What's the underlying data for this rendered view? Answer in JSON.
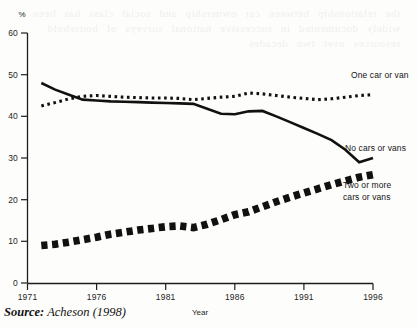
{
  "figure": {
    "y_axis_unit_label": "%",
    "x_axis_title": "Year",
    "source_prefix": "Source:",
    "source_text": "Acheson (1998)"
  },
  "chart_data": {
    "type": "line",
    "title": "",
    "subtitle": "",
    "xlabel": "Year",
    "ylabel": "%",
    "xlim": [
      1971,
      1996
    ],
    "ylim": [
      0,
      60
    ],
    "grid": false,
    "legend_position": "inline-right-of-series",
    "x_ticks": [
      "1971",
      "1976",
      "1981",
      "1986",
      "1991",
      "1996"
    ],
    "y_ticks": [
      "0",
      "10",
      "20",
      "30",
      "40",
      "50",
      "60"
    ],
    "x": [
      1972,
      1973,
      1974,
      1975,
      1976,
      1977,
      1978,
      1979,
      1980,
      1981,
      1982,
      1983,
      1984,
      1985,
      1986,
      1987,
      1988,
      1989,
      1990,
      1991,
      1992,
      1993,
      1994,
      1995,
      1996
    ],
    "series": [
      {
        "name": "No cars or vans",
        "style": "solid",
        "label": "No cars or vans",
        "values": [
          48.0,
          46.4,
          45.2,
          44.0,
          43.8,
          43.6,
          43.5,
          43.4,
          43.3,
          43.2,
          43.1,
          43.0,
          41.8,
          40.6,
          40.5,
          41.2,
          41.3,
          40.0,
          38.6,
          37.2,
          35.8,
          34.3,
          32.0,
          29.0,
          30.0
        ]
      },
      {
        "name": "One car or van",
        "style": "dotted",
        "label": "One car or van",
        "values": [
          42.5,
          43.3,
          44.2,
          44.8,
          45.0,
          44.8,
          44.6,
          44.5,
          44.4,
          44.4,
          44.3,
          44.0,
          44.3,
          44.6,
          44.8,
          45.6,
          45.4,
          45.0,
          44.6,
          44.3,
          44.0,
          44.2,
          44.6,
          45.0,
          45.2
        ]
      },
      {
        "name": "Two or more cars or vans",
        "style": "dashed-thick",
        "label_line1": "Two or more",
        "label_line2": "cars or vans",
        "values": [
          9.0,
          9.3,
          9.8,
          10.4,
          11.0,
          11.7,
          12.2,
          12.7,
          13.1,
          13.5,
          13.7,
          13.3,
          14.1,
          15.2,
          16.4,
          17.1,
          18.3,
          19.5,
          20.6,
          21.6,
          22.6,
          23.6,
          24.5,
          25.4,
          26.0
        ]
      }
    ]
  },
  "bleed_through": {
    "text": "the relationship between car ownership and social class has been widely documented in successive national surveys of household resources over two decades"
  }
}
